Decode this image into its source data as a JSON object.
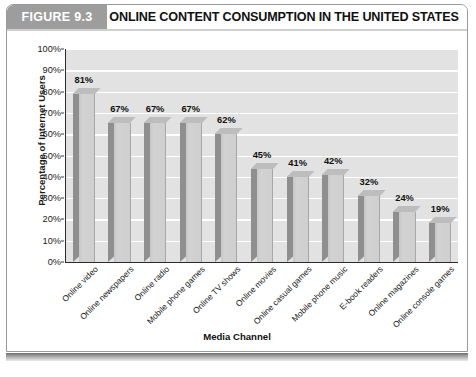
{
  "figure": {
    "badge_label": "FIGURE 9.3",
    "title": "ONLINE CONTENT CONSUMPTION IN THE UNITED STATES"
  },
  "chart_data": {
    "type": "bar",
    "title": "ONLINE CONTENT CONSUMPTION IN THE UNITED STATES",
    "xlabel": "Media Channel",
    "ylabel": "Percentage of Internet Users",
    "ylim": [
      0,
      100
    ],
    "ytick_labels": [
      "100%",
      "90%",
      "80%",
      "70%",
      "60%",
      "50%",
      "40%",
      "30%",
      "20%",
      "10%",
      "0%"
    ],
    "ytick_values": [
      100,
      90,
      80,
      70,
      60,
      50,
      40,
      30,
      20,
      10,
      0
    ],
    "grid": true,
    "legend": false,
    "categories": [
      "Online video",
      "Online newspapers",
      "Online radio",
      "Mobile phone games",
      "Online TV shows",
      "Online movies",
      "Online casual games",
      "Mobile phone music",
      "E-book readers",
      "Online magazines",
      "Online console games"
    ],
    "values": [
      81,
      67,
      67,
      67,
      62,
      45,
      41,
      42,
      32,
      24,
      19
    ],
    "data_labels": [
      "81%",
      "67%",
      "67%",
      "67%",
      "62%",
      "45%",
      "41%",
      "42%",
      "32%",
      "24%",
      "19%"
    ]
  },
  "colors": {
    "badge_background": "#9d9d9d",
    "plot_background": "#e2e2e2",
    "gridline": "#ffffff",
    "bar_front": "#cfcfcf",
    "bar_side": "#8f8f8f",
    "bar_top": "#bdbdbd",
    "axis": "#2b2b2b",
    "text": "#111111"
  }
}
